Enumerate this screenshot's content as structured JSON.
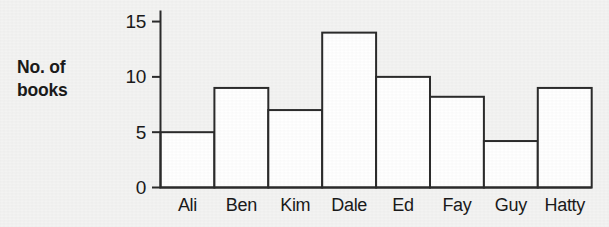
{
  "chart_data": {
    "type": "bar",
    "title": "",
    "xlabel": "",
    "ylabel": "No. of books",
    "ylabel_lines": [
      "No. of",
      "books"
    ],
    "categories": [
      "Ali",
      "Ben",
      "Kim",
      "Dale",
      "Ed",
      "Fay",
      "Guy",
      "Hatty"
    ],
    "values": [
      5,
      9,
      7,
      14,
      10,
      8.2,
      4.2,
      9
    ],
    "ylim": [
      0,
      16
    ],
    "yticks": [
      0,
      5,
      10,
      15
    ],
    "ytick_labels": [
      "0",
      "5",
      "10",
      "15"
    ],
    "grid": false,
    "legend": null,
    "bar_fill": "#ffffff",
    "bar_stroke": "#2b2b2b",
    "axis_color": "#2b2b2b",
    "background": "#f3f3f2"
  }
}
